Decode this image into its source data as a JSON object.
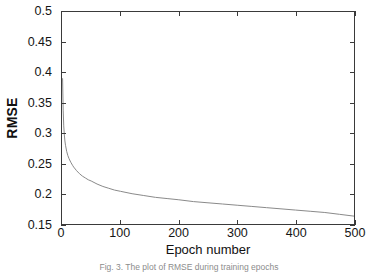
{
  "figure": {
    "caption": "Fig. 3. The plot of RMSE during training epochs",
    "background_color": "#ffffff",
    "axis_color": "#3a3a3a",
    "curve_color": "#8a8a8a"
  },
  "axes": {
    "y_title": "RMSE",
    "x_title": "Epoch number",
    "y_ticklabels": [
      "0.5",
      "0.45",
      "0.4",
      "0.35",
      "0.3",
      "0.25",
      "0.2",
      "0.15"
    ],
    "x_ticklabels": [
      "0",
      "100",
      "200",
      "300",
      "400",
      "500"
    ]
  },
  "chart_data": {
    "type": "line",
    "title": "",
    "subtitle": "",
    "xlabel": "Epoch number",
    "ylabel": "RMSE",
    "xlim": [
      0,
      500
    ],
    "ylim": [
      0.15,
      0.5
    ],
    "xticks": [
      0,
      100,
      200,
      300,
      400,
      500
    ],
    "yticks": [
      0.15,
      0.2,
      0.25,
      0.3,
      0.35,
      0.4,
      0.45,
      0.5
    ],
    "grid": false,
    "legend": null,
    "legend_position": "none",
    "line_color": "#8a8a8a",
    "line_width": 1,
    "series": [
      {
        "name": "RMSE",
        "x": [
          1,
          2,
          3,
          4,
          5,
          6,
          8,
          10,
          12,
          15,
          18,
          20,
          25,
          30,
          35,
          40,
          45,
          50,
          60,
          70,
          80,
          90,
          100,
          120,
          140,
          160,
          180,
          200,
          225,
          250,
          275,
          300,
          325,
          350,
          375,
          400,
          425,
          450,
          475,
          500
        ],
        "y": [
          0.39,
          0.338,
          0.312,
          0.297,
          0.287,
          0.28,
          0.27,
          0.263,
          0.258,
          0.252,
          0.247,
          0.244,
          0.238,
          0.233,
          0.229,
          0.226,
          0.223,
          0.221,
          0.216,
          0.212,
          0.209,
          0.206,
          0.204,
          0.2,
          0.197,
          0.194,
          0.192,
          0.19,
          0.187,
          0.185,
          0.183,
          0.181,
          0.179,
          0.177,
          0.175,
          0.173,
          0.171,
          0.169,
          0.166,
          0.163
        ]
      }
    ]
  }
}
